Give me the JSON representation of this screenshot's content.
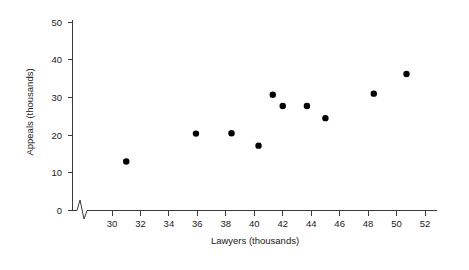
{
  "chart_data": {
    "type": "scatter",
    "title": "",
    "xlabel": "Lawyers (thousands)",
    "ylabel": "Appeals (thousands)",
    "xlim": [
      29,
      52.8
    ],
    "ylim": [
      0,
      53
    ],
    "xticks": [
      30,
      32,
      34,
      36,
      38,
      40,
      42,
      44,
      46,
      48,
      50,
      52
    ],
    "yticks": [
      0,
      10,
      20,
      30,
      40,
      50
    ],
    "xtick_labels": [
      "30",
      "32",
      "34",
      "36",
      "38",
      "40",
      "42",
      "44",
      "46",
      "48",
      "50",
      "52"
    ],
    "ytick_labels": [
      "0",
      "10",
      "20",
      "30",
      "40",
      "50"
    ],
    "grid": false,
    "legend": null,
    "axis_break": {
      "axis": "x",
      "shape": "zigzag",
      "position": 29.4,
      "note": "broken x-axis between origin and 30"
    },
    "marker": {
      "shape": "circle",
      "color": "#000000",
      "size": 3.2
    },
    "points": [
      {
        "x": 31.0,
        "y": 13.0
      },
      {
        "x": 35.9,
        "y": 20.4
      },
      {
        "x": 38.4,
        "y": 20.5
      },
      {
        "x": 40.3,
        "y": 17.2
      },
      {
        "x": 41.3,
        "y": 30.7
      },
      {
        "x": 42.0,
        "y": 27.7
      },
      {
        "x": 43.7,
        "y": 27.7
      },
      {
        "x": 45.0,
        "y": 24.5
      },
      {
        "x": 48.4,
        "y": 31.0
      },
      {
        "x": 50.7,
        "y": 36.2
      }
    ],
    "series": [
      {
        "name": "Lawyers vs Appeals",
        "x": [
          31.0,
          35.9,
          38.4,
          40.3,
          41.3,
          42.0,
          43.7,
          45.0,
          48.4,
          50.7
        ],
        "values": [
          13.0,
          20.4,
          20.5,
          17.2,
          30.7,
          27.7,
          27.7,
          24.5,
          31.0,
          36.2
        ]
      }
    ],
    "colors": {
      "marker": "#000000",
      "axis": "#3a3a3a",
      "text": "#1a1a1a",
      "background": "#ffffff"
    }
  }
}
